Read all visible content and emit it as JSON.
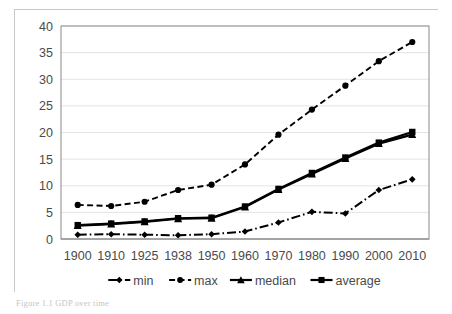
{
  "figure": {
    "caption": "Figure 1.1 GDP over time",
    "frame_color": "#c9c9c9",
    "background": "#ffffff"
  },
  "chart_data": {
    "type": "line",
    "title": "",
    "subtitle": "",
    "xlabel": "",
    "ylabel": "",
    "grid": true,
    "legend_position": "bottom",
    "ylim": [
      0,
      40
    ],
    "ytick_step": 5,
    "yticks": [
      "0",
      "5",
      "10",
      "15",
      "20",
      "25",
      "30",
      "35",
      "40"
    ],
    "categories": [
      "1900",
      "1910",
      "1925",
      "1938",
      "1950",
      "1960",
      "1970",
      "1980",
      "1990",
      "2000",
      "2010"
    ],
    "series": [
      {
        "name": "min",
        "marker": "diamond",
        "linestyle": "dash-dot",
        "color": "#000000",
        "values": [
          0.8,
          0.9,
          0.8,
          0.7,
          0.9,
          1.4,
          3.1,
          5.1,
          4.8,
          9.2,
          11.2
        ]
      },
      {
        "name": "max",
        "marker": "circle",
        "linestyle": "dashed",
        "color": "#000000",
        "values": [
          6.4,
          6.2,
          7.0,
          9.2,
          10.2,
          14.0,
          19.6,
          24.3,
          28.8,
          33.4,
          37.0
        ]
      },
      {
        "name": "median",
        "marker": "triangle",
        "linestyle": "solid",
        "color": "#000000",
        "values": [
          2.5,
          2.8,
          3.2,
          3.8,
          3.9,
          6.0,
          9.3,
          12.2,
          15.1,
          17.9,
          19.6
        ]
      },
      {
        "name": "average",
        "marker": "square",
        "linestyle": "solid",
        "color": "#000000",
        "values": [
          2.6,
          2.9,
          3.3,
          3.9,
          4.0,
          6.1,
          9.4,
          12.4,
          15.3,
          18.1,
          20.1
        ]
      }
    ]
  },
  "legend": {
    "items": [
      {
        "label": "min"
      },
      {
        "label": "max"
      },
      {
        "label": "median"
      },
      {
        "label": "average"
      }
    ]
  }
}
